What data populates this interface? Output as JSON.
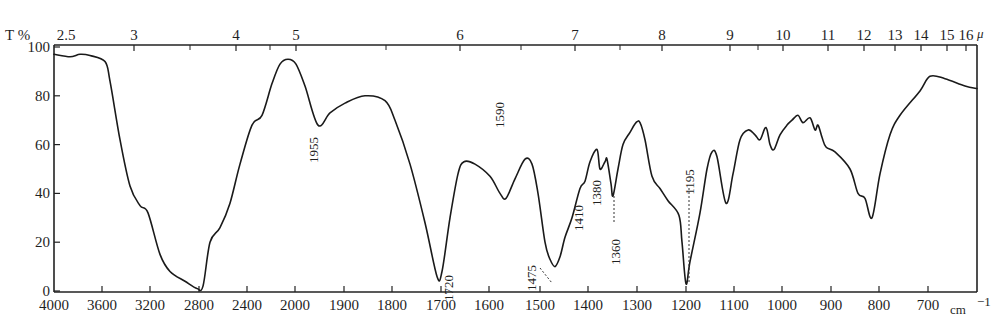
{
  "chart_data": {
    "type": "line",
    "title": "",
    "ylabel": "T %",
    "xlabel": "cm⁻¹",
    "x2label": "μ",
    "ylim": [
      0,
      100
    ],
    "grid": false,
    "legend": null,
    "y_ticks": [
      0,
      20,
      40,
      60,
      80,
      100
    ],
    "x_ticks_wavenumber": [
      "4000",
      "3600",
      "3200",
      "2800",
      "2400",
      "2000",
      "1900",
      "1800",
      "1700",
      "1600",
      "1500",
      "1400",
      "1300",
      "1200",
      "1100",
      "1000",
      "900",
      "800",
      "700"
    ],
    "x_ticks_wavelength_um": [
      "2.5",
      "3",
      "4",
      "5",
      "6",
      "7",
      "8",
      "9",
      "10",
      "11",
      "12",
      "13",
      "14",
      "15",
      "16"
    ],
    "peak_annotations": [
      {
        "label": "1955",
        "wavenumber": 1955,
        "transmittance": 68
      },
      {
        "label": "1720",
        "wavenumber": 1720,
        "transmittance": 6
      },
      {
        "label": "1590",
        "wavenumber": 1590,
        "transmittance": 38
      },
      {
        "label": "1475",
        "wavenumber": 1475,
        "transmittance": 10
      },
      {
        "label": "1410",
        "wavenumber": 1410,
        "transmittance": 42
      },
      {
        "label": "1380",
        "wavenumber": 1380,
        "transmittance": 53
      },
      {
        "label": "1360",
        "wavenumber": 1360,
        "transmittance": 39
      },
      {
        "label": "1195",
        "wavenumber": 1195,
        "transmittance": 3
      }
    ],
    "series": [
      {
        "name": "IR spectrum",
        "points_px_T": [
          [
            54,
            97
          ],
          [
            70,
            96
          ],
          [
            80,
            97
          ],
          [
            90,
            96.5
          ],
          [
            105,
            94
          ],
          [
            110,
            86
          ],
          [
            120,
            62
          ],
          [
            130,
            43
          ],
          [
            140,
            35
          ],
          [
            148,
            32
          ],
          [
            160,
            15
          ],
          [
            170,
            8
          ],
          [
            185,
            4
          ],
          [
            197,
            1
          ],
          [
            203,
            2
          ],
          [
            210,
            20
          ],
          [
            220,
            26
          ],
          [
            230,
            36
          ],
          [
            240,
            52
          ],
          [
            252,
            68
          ],
          [
            262,
            72
          ],
          [
            272,
            85
          ],
          [
            280,
            93
          ],
          [
            288,
            95
          ],
          [
            296,
            93
          ],
          [
            305,
            84
          ],
          [
            318,
            68
          ],
          [
            330,
            73
          ],
          [
            345,
            77
          ],
          [
            365,
            80
          ],
          [
            385,
            78
          ],
          [
            395,
            70
          ],
          [
            410,
            52
          ],
          [
            425,
            28
          ],
          [
            437,
            6
          ],
          [
            442,
            8
          ],
          [
            450,
            30
          ],
          [
            458,
            48
          ],
          [
            464,
            53
          ],
          [
            475,
            52
          ],
          [
            490,
            47
          ],
          [
            500,
            40
          ],
          [
            506,
            38
          ],
          [
            515,
            46
          ],
          [
            525,
            54
          ],
          [
            532,
            52
          ],
          [
            538,
            40
          ],
          [
            545,
            20
          ],
          [
            550,
            13
          ],
          [
            555,
            10
          ],
          [
            560,
            14
          ],
          [
            565,
            22
          ],
          [
            572,
            30
          ],
          [
            580,
            42
          ],
          [
            585,
            45
          ],
          [
            590,
            53
          ],
          [
            597,
            58
          ],
          [
            600,
            50
          ],
          [
            605,
            53
          ],
          [
            607,
            54
          ],
          [
            611,
            44
          ],
          [
            613,
            39
          ],
          [
            618,
            50
          ],
          [
            623,
            60
          ],
          [
            630,
            65
          ],
          [
            636,
            69
          ],
          [
            640,
            69
          ],
          [
            645,
            62
          ],
          [
            652,
            47
          ],
          [
            660,
            42
          ],
          [
            668,
            37
          ],
          [
            679,
            31
          ],
          [
            682,
            20
          ],
          [
            686,
            3
          ],
          [
            690,
            12
          ],
          [
            700,
            32
          ],
          [
            707,
            50
          ],
          [
            712,
            57
          ],
          [
            717,
            55
          ],
          [
            726,
            36
          ],
          [
            733,
            48
          ],
          [
            740,
            62
          ],
          [
            748,
            66
          ],
          [
            755,
            64
          ],
          [
            760,
            62
          ],
          [
            766,
            67
          ],
          [
            770,
            60
          ],
          [
            774,
            58
          ],
          [
            780,
            64
          ],
          [
            787,
            68
          ],
          [
            792,
            70
          ],
          [
            798,
            72
          ],
          [
            803,
            69
          ],
          [
            810,
            71
          ],
          [
            815,
            66
          ],
          [
            818,
            68
          ],
          [
            822,
            63
          ],
          [
            826,
            59
          ],
          [
            835,
            57
          ],
          [
            850,
            50
          ],
          [
            858,
            40
          ],
          [
            865,
            38
          ],
          [
            872,
            30
          ],
          [
            880,
            48
          ],
          [
            890,
            64
          ],
          [
            900,
            72
          ],
          [
            920,
            82
          ],
          [
            930,
            88
          ],
          [
            945,
            87
          ],
          [
            965,
            84
          ],
          [
            977,
            83
          ]
        ]
      }
    ]
  },
  "axes": {
    "y_title": "T %",
    "x_unit": "cm",
    "x_unit_exp": "−1",
    "top_unit": "μ"
  },
  "layout": {
    "plot": {
      "left": 54,
      "right": 977,
      "top": 45,
      "bottom": 292
    },
    "y0_px": 291,
    "y_per_unit": 2.44,
    "bottom_tick_px": [
      54,
      102,
      150,
      199,
      247,
      295,
      344,
      392,
      441,
      489,
      540,
      588,
      637,
      686,
      734,
      782,
      831,
      879,
      928
    ],
    "top_tick_px": [
      65,
      134,
      236,
      296,
      460,
      575,
      662,
      730,
      783,
      828,
      864,
      895,
      921,
      947,
      966
    ],
    "minor_top_tick_px": [
      190,
      270,
      386,
      521,
      620,
      758
    ],
    "peak_label_px": [
      {
        "x": 318,
        "y": 150,
        "line": null
      },
      {
        "x": 453,
        "y": 288,
        "line": null
      },
      {
        "x": 504,
        "y": 115,
        "line": null
      },
      {
        "x": 536,
        "y": 278,
        "line": [
          [
            540,
            268
          ],
          [
            552,
            283
          ]
        ]
      },
      {
        "x": 583,
        "y": 218,
        "line": null
      },
      {
        "x": 601,
        "y": 193,
        "line": null
      },
      {
        "x": 620,
        "y": 252,
        "line": [
          [
            614,
            196
          ],
          [
            614,
            222
          ]
        ]
      },
      {
        "x": 694,
        "y": 182,
        "line": [
          [
            689,
            188
          ],
          [
            689,
            283
          ]
        ]
      }
    ]
  }
}
